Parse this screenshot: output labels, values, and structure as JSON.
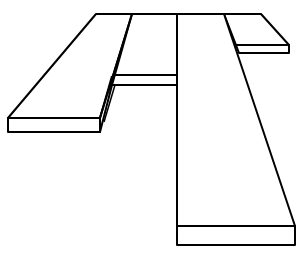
{
  "figure": {
    "stroke_color": "#000000",
    "background_color": "#ffffff",
    "planks": [
      {
        "name": "left-plank",
        "top": [
          [
            96,
            14
          ],
          [
            132,
            14
          ],
          [
            100,
            118
          ],
          [
            8,
            118
          ]
        ],
        "front": [
          [
            8,
            118
          ],
          [
            100,
            118
          ],
          [
            100,
            132
          ],
          [
            8,
            132
          ]
        ],
        "side": [
          [
            100,
            118
          ],
          [
            112,
            75
          ],
          [
            112,
            85
          ],
          [
            100,
            132
          ]
        ]
      },
      {
        "name": "middle-crossbar",
        "front": [
          [
            112,
            75
          ],
          [
            177,
            75
          ],
          [
            177,
            85
          ],
          [
            112,
            85
          ]
        ]
      },
      {
        "name": "right-plank",
        "top": [
          [
            177,
            14
          ],
          [
            224,
            14
          ],
          [
            295,
            226
          ],
          [
            177,
            226
          ]
        ],
        "front": [
          [
            177,
            226
          ],
          [
            295,
            226
          ],
          [
            295,
            245
          ],
          [
            177,
            245
          ]
        ]
      },
      {
        "name": "top-right-plank",
        "top": [
          [
            224,
            14
          ],
          [
            261,
            14
          ],
          [
            289,
            45
          ],
          [
            236,
            45
          ]
        ],
        "front": [
          [
            236,
            45
          ],
          [
            289,
            45
          ],
          [
            289,
            53
          ],
          [
            238,
            53
          ]
        ]
      }
    ]
  }
}
